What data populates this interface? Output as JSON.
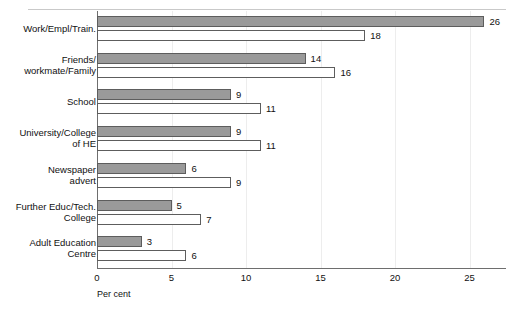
{
  "chart_data": {
    "type": "bar",
    "orientation": "horizontal",
    "title": "",
    "xlabel": "Per cent",
    "ylabel": "",
    "xlim": [
      0,
      27.5
    ],
    "xticks": [
      0,
      5,
      10,
      15,
      20,
      25
    ],
    "grid": true,
    "legend": "none",
    "categories": [
      "Work/Empl/Train.",
      "Friends/ workmate/Family",
      "School",
      "University/College of HE",
      "Newspaper advert",
      "Further Educ/Tech. College",
      "Adult Education Centre"
    ],
    "category_lines": [
      [
        "Work/Empl/Train."
      ],
      [
        "Friends/",
        "workmate/Family"
      ],
      [
        "School"
      ],
      [
        "University/College",
        "of HE"
      ],
      [
        "Newspaper",
        "advert"
      ],
      [
        "Further Educ/Tech.",
        "College"
      ],
      [
        "Adult Education",
        "Centre"
      ]
    ],
    "series": [
      {
        "name": "series-1",
        "style": "filled",
        "values": [
          26,
          14,
          9,
          9,
          6,
          5,
          3
        ]
      },
      {
        "name": "series-2",
        "style": "hollow",
        "values": [
          18,
          16,
          11,
          11,
          9,
          7,
          6
        ]
      }
    ]
  },
  "colors": {
    "filled_bar": "#9a9a9a",
    "bar_border": "#5d5d5d",
    "gridline": "#ededed",
    "axis": "#6e6e6e",
    "text": "#111111",
    "top_rule": "#c9c9c9",
    "background": "#ffffff"
  }
}
